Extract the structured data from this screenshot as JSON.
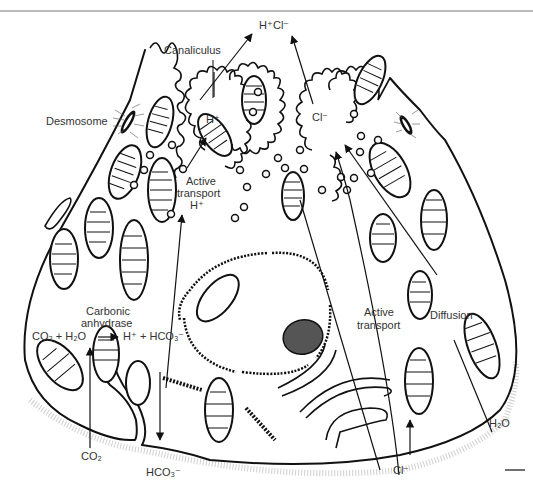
{
  "figure": {
    "labels": {
      "hcl_output": "H⁺Cl⁻",
      "canaliculus": "Canaliculus",
      "desmosome": "Desmosome",
      "h_plus": "H⁺",
      "cl_minus_canaliculus": "Cl⁻",
      "active_transport_h_line1": "Active",
      "active_transport_h_line2": "transport",
      "active_transport_h_line3": "H⁺",
      "carbonic_anhydrase_line1": "Carbonic",
      "carbonic_anhydrase_line2": "anhydrase",
      "reaction_left": "CO₂ + H₂O",
      "reaction_right": "H⁺ + HCO₃⁻",
      "active_transport_cl_line1": "Active",
      "active_transport_cl_line2": "transport",
      "diffusion": "Diffusion",
      "co2_input": "CO₂",
      "hco3_output": "HCO₃⁻",
      "cl_input": "Cl⁻",
      "h2o_input": "H₂O"
    },
    "structures": [
      "canaliculus",
      "desmosome",
      "mitochondria",
      "vesicles",
      "nucleus",
      "nucleolus",
      "rough endoplasmic reticulum",
      "basal membrane"
    ],
    "colors": {
      "line": "#111111",
      "text": "#333333",
      "background": "#ffffff",
      "stipple": "#bbbbbb"
    }
  }
}
